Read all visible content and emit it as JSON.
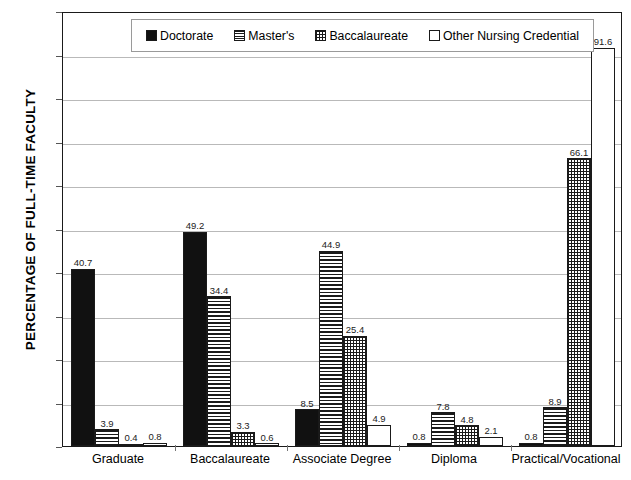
{
  "chart_data": {
    "type": "bar",
    "title": "",
    "xlabel": "",
    "ylabel": "PERCENTAGE OF FULL-TIME FACULTY",
    "ylim": [
      0,
      100
    ],
    "ytick_step": 10,
    "yticks": [
      "100",
      "90",
      "80",
      "70",
      "60",
      "50",
      "40",
      "30",
      "20",
      "10",
      "0"
    ],
    "grid": true,
    "legend_position": "top-center",
    "categories": [
      "Graduate",
      "Baccalaureate",
      "Associate Degree",
      "Diploma",
      "Practical/Vocational"
    ],
    "series": [
      {
        "name": "Doctorate",
        "pattern": "solid-black",
        "color": "#111111",
        "values": [
          40.7,
          49.2,
          8.5,
          0.8,
          0.8
        ],
        "labels": [
          "40.7",
          "49.2",
          "8.5",
          "0.8",
          "0.8"
        ]
      },
      {
        "name": "Master's",
        "pattern": "horizontal-lines",
        "color": "#ffffff",
        "values": [
          3.9,
          34.4,
          44.9,
          7.8,
          8.9
        ],
        "labels": [
          "3.9",
          "34.4",
          "44.9",
          "7.8",
          "8.9"
        ]
      },
      {
        "name": "Baccalaureate",
        "pattern": "crosshatch-grid",
        "color": "#ffffff",
        "values": [
          0.4,
          3.3,
          25.4,
          4.8,
          66.1
        ],
        "labels": [
          "0.4",
          "3.3",
          "25.4",
          "4.8",
          "66.1"
        ]
      },
      {
        "name": "Other Nursing Credential",
        "pattern": "white-empty",
        "color": "#ffffff",
        "values": [
          0.8,
          0.6,
          4.9,
          2.1,
          91.6
        ],
        "labels": [
          "0.8",
          "0.6",
          "4.9",
          "2.1",
          "91.6"
        ]
      }
    ]
  },
  "legend": {
    "items": [
      {
        "label": "Doctorate",
        "swatch": "doctorate"
      },
      {
        "label": "Master's",
        "swatch": "masters"
      },
      {
        "label": "Baccalaureate",
        "swatch": "baccalaureate"
      },
      {
        "label": "Other Nursing Credential",
        "swatch": "other"
      }
    ]
  }
}
